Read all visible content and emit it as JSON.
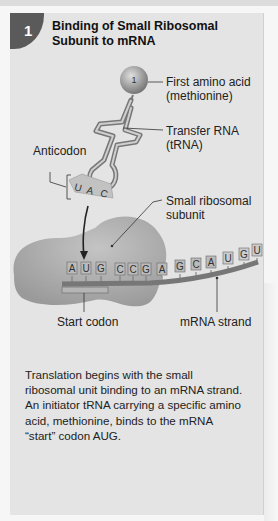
{
  "step": {
    "number": "1",
    "title": "Binding of Small Ribosomal Subunit to mRNA"
  },
  "labels": {
    "amino_acid_number": "1",
    "first_amino_acid": "First amino acid",
    "first_amino_acid_sub": "(methionine)",
    "transfer_rna": "Transfer RNA",
    "transfer_rna_sub": "(tRNA)",
    "anticodon": "Anticodon",
    "small_subunit": "Small ribosomal",
    "small_subunit_sub": "subunit",
    "start_codon": "Start codon",
    "mrna_strand": "mRNA strand"
  },
  "anticodon_bases": [
    "U",
    "A",
    "C"
  ],
  "mrna_bases": [
    "A",
    "U",
    "G",
    "C",
    "C",
    "G",
    "A",
    "G",
    "C",
    "A",
    "U",
    "G",
    "U"
  ],
  "description": "Translation begins with the small ribosomal unit binding to an mRNA strand. An initiator tRNA carrying a specific amino acid, methionine, binds to the mRNA “start” codon AUG.",
  "colors": {
    "panel": "#e4e4e4",
    "badge": "#5a5a5a",
    "ribosome": "#a9a9a9",
    "trna": "#8a8a8a",
    "mrna": "#7a7a7a"
  }
}
